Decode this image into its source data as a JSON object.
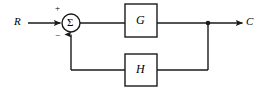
{
  "diagram": {
    "type": "control-system-block-diagram",
    "background_color": "#ffffff",
    "line_color": "#1a1a1a",
    "line_width": 1.4,
    "signals": {
      "input_label": "R",
      "output_label": "C"
    },
    "summing_junction": {
      "symbol": "Σ",
      "shape": "circle",
      "center_x": 71,
      "center_y": 23,
      "radius": 9,
      "positive_sign": "+",
      "negative_sign": "−"
    },
    "blocks": [
      {
        "name": "forward-path-block",
        "label": "G",
        "x": 125,
        "y": 4,
        "width": 32,
        "height": 33
      },
      {
        "name": "feedback-path-block",
        "label": "H",
        "x": 125,
        "y": 54,
        "width": 32,
        "height": 32
      }
    ],
    "nodes": [
      {
        "name": "output-takeoff-node",
        "x": 208,
        "y": 23,
        "radius": 2.3
      }
    ],
    "paths": {
      "input_line": {
        "from_x": 28,
        "to_x": 62,
        "y": 23
      },
      "sum_to_G": {
        "from_x": 80,
        "to_x": 125,
        "y": 23
      },
      "G_to_node": {
        "from_x": 157,
        "to_x": 208,
        "y": 23
      },
      "node_to_output": {
        "from_x": 208,
        "to_x": 244,
        "y": 23
      },
      "node_down": {
        "x": 208,
        "from_y": 23,
        "to_y": 70
      },
      "node_to_H": {
        "from_x": 208,
        "to_x": 157,
        "y": 70
      },
      "H_to_corner": {
        "from_x": 125,
        "to_x": 71,
        "y": 70
      },
      "corner_up_to_sum": {
        "x": 71,
        "from_y": 70,
        "to_y": 32
      }
    }
  }
}
